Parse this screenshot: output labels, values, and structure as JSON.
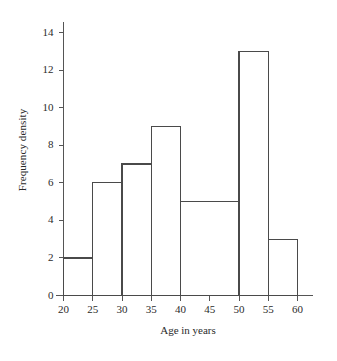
{
  "chart_data": {
    "type": "bar",
    "title": "",
    "subtitle": "",
    "xlabel": "Age in years",
    "ylabel": "Frequency density",
    "xlim": [
      20,
      60
    ],
    "ylim": [
      0,
      14
    ],
    "grid": false,
    "legend": null,
    "xticks": [
      20,
      25,
      30,
      35,
      40,
      45,
      50,
      55,
      60
    ],
    "xtick_labels": [
      "20",
      "25",
      "30",
      "35",
      "40",
      "45",
      "50",
      "55",
      "60"
    ],
    "yticks": [
      0,
      2,
      4,
      6,
      8,
      10,
      12,
      14
    ],
    "ytick_labels": [
      "0",
      "2",
      "4",
      "6",
      "8",
      "10",
      "12",
      "14"
    ],
    "bar_style": "unfilled-outline",
    "bars": [
      {
        "label": "20-25",
        "x_start": 20,
        "x_end": 25,
        "value": 2
      },
      {
        "label": "25-30",
        "x_start": 25,
        "x_end": 30,
        "value": 6
      },
      {
        "label": "30-35",
        "x_start": 30,
        "x_end": 35,
        "value": 7
      },
      {
        "label": "35-40",
        "x_start": 35,
        "x_end": 40,
        "value": 9
      },
      {
        "label": "40-50",
        "x_start": 40,
        "x_end": 50,
        "value": 5
      },
      {
        "label": "50-55",
        "x_start": 50,
        "x_end": 55,
        "value": 13
      },
      {
        "label": "55-60",
        "x_start": 55,
        "x_end": 60,
        "value": 3
      }
    ],
    "categories": [
      "20-25",
      "25-30",
      "30-35",
      "35-40",
      "40-50",
      "50-55",
      "55-60"
    ],
    "values": [
      2,
      6,
      7,
      9,
      5,
      13,
      3
    ],
    "colors": {
      "background": "#ffffff",
      "axis": "#555555",
      "bar_outline": "#4a4a4a",
      "text": "#2b2b2b"
    }
  }
}
